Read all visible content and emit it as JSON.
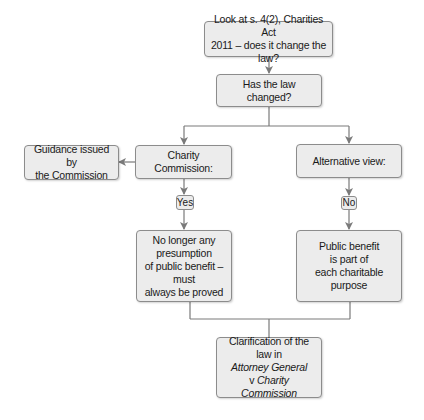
{
  "colors": {
    "box_fill": "#ececec",
    "box_border": "#8c8c8c",
    "connector": "#7a7a7a",
    "text": "#1a1a1a"
  },
  "nodes": {
    "start": {
      "lines": [
        "Look at s. 4(2), Charities Act",
        "2011 – does it change the law?"
      ]
    },
    "question": {
      "label": "Has the law changed?"
    },
    "guidance": {
      "lines": [
        "Guidance issued by",
        "the Commission"
      ]
    },
    "charity_commission": {
      "label": "Charity Commission:"
    },
    "alternative": {
      "label": "Alternative view:"
    },
    "yes_label": "Yes",
    "no_label": "No",
    "no_presumption": {
      "lines": [
        "No longer any presumption",
        "of public benefit – must",
        "always be proved"
      ]
    },
    "public_benefit": {
      "lines": [
        "Public benefit",
        "is part of",
        "each charitable",
        "purpose"
      ]
    },
    "clarification": {
      "line1": "Clarification of the law in",
      "line2_italic": "Attorney General",
      "line3_plain": "v ",
      "line3_italic": "Charity",
      "line4_italic": "Commission"
    }
  },
  "edges": [
    {
      "from": "start",
      "to": "question"
    },
    {
      "from": "question",
      "to": "charity_commission"
    },
    {
      "from": "question",
      "to": "alternative"
    },
    {
      "from": "charity_commission",
      "to": "guidance"
    },
    {
      "from": "charity_commission",
      "to": "yes_label"
    },
    {
      "from": "yes_label",
      "to": "no_presumption"
    },
    {
      "from": "alternative",
      "to": "no_label"
    },
    {
      "from": "no_label",
      "to": "public_benefit"
    },
    {
      "from": "no_presumption",
      "to": "clarification"
    },
    {
      "from": "public_benefit",
      "to": "clarification"
    }
  ]
}
